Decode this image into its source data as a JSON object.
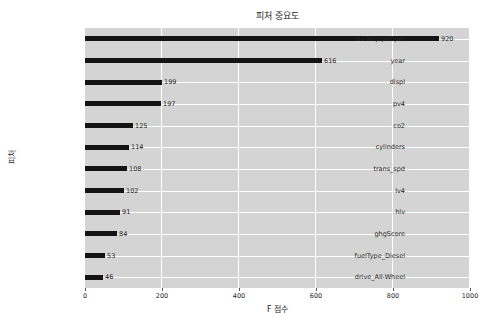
{
  "chart": {
    "title": "피처 중요도",
    "xlabel": "F 점수",
    "ylabel": "피처"
  },
  "chart_data": {
    "type": "bar",
    "orientation": "horizontal",
    "title": "피처 중요도",
    "xlabel": "F 점수",
    "ylabel": "피처",
    "categories": [
      "co2TailpipeGpm",
      "year",
      "displ",
      "pv4",
      "co2",
      "cylinders",
      "trans_spd",
      "lv4",
      "hlv",
      "ghgScore",
      "fuelType_Diesel",
      "drive_All-Wheel"
    ],
    "values": [
      920,
      616,
      199,
      197,
      125,
      114,
      108,
      102,
      91,
      84,
      53,
      46
    ],
    "xlim": [
      0,
      1000
    ],
    "xticks": [
      0,
      200,
      400,
      600,
      800,
      1000
    ],
    "grid": true,
    "legend": null,
    "colors": {
      "bar": "#141414",
      "plot_bg": "#d4d4d4",
      "grid": "#ffffff",
      "figure_bg": "#ffffff",
      "text": "#262626"
    }
  }
}
